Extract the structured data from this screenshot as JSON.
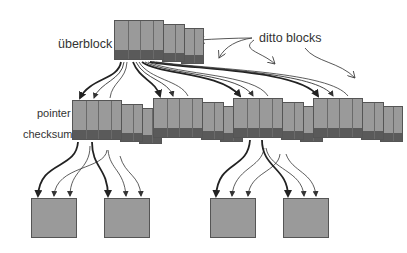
{
  "diagram": {
    "labels": {
      "uberblock": "überblock",
      "ditto_blocks": "ditto blocks",
      "pointer": "pointer",
      "checksum": "checksum"
    },
    "colors": {
      "background": "#ffffff",
      "block_fill": "#9a9a9a",
      "block_checksum": "#5a5a5a",
      "block_border": "#555555",
      "arrow": "#222222",
      "text": "#333333"
    },
    "uberblock": {
      "x": 114,
      "y": 20,
      "w": 50,
      "h": 40,
      "copies": 3,
      "cells": 4
    },
    "indirect_groups": [
      {
        "x": 72,
        "y": 100,
        "w": 50,
        "h": 40,
        "copies": 3,
        "cells": 4
      },
      {
        "x": 153,
        "y": 98,
        "w": 50,
        "h": 40,
        "copies": 3,
        "cells": 4
      },
      {
        "x": 233,
        "y": 98,
        "w": 50,
        "h": 40,
        "copies": 3,
        "cells": 4
      },
      {
        "x": 313,
        "y": 98,
        "w": 50,
        "h": 40,
        "copies": 3,
        "cells": 4
      }
    ],
    "data_blocks": [
      {
        "x": 31,
        "y": 198,
        "w": 46,
        "h": 40
      },
      {
        "x": 104,
        "y": 198,
        "w": 46,
        "h": 40
      },
      {
        "x": 210,
        "y": 198,
        "w": 46,
        "h": 40
      },
      {
        "x": 283,
        "y": 198,
        "w": 46,
        "h": 40
      }
    ]
  }
}
